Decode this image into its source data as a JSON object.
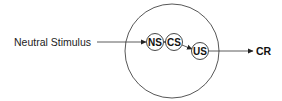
{
  "diagram": {
    "input_label": "Neutral Stimulus",
    "nodes": [
      {
        "id": "ns",
        "label": "NS"
      },
      {
        "id": "cs",
        "label": "CS"
      },
      {
        "id": "us",
        "label": "US"
      }
    ],
    "output_label": "CR",
    "edges": [
      {
        "from": "input",
        "to": "ns"
      },
      {
        "from": "cs",
        "to": "ns"
      },
      {
        "from": "cs",
        "to": "us"
      },
      {
        "from": "us",
        "to": "output"
      }
    ],
    "colors": {
      "stroke": "#333333",
      "text": "#111111",
      "background": "#ffffff"
    }
  }
}
